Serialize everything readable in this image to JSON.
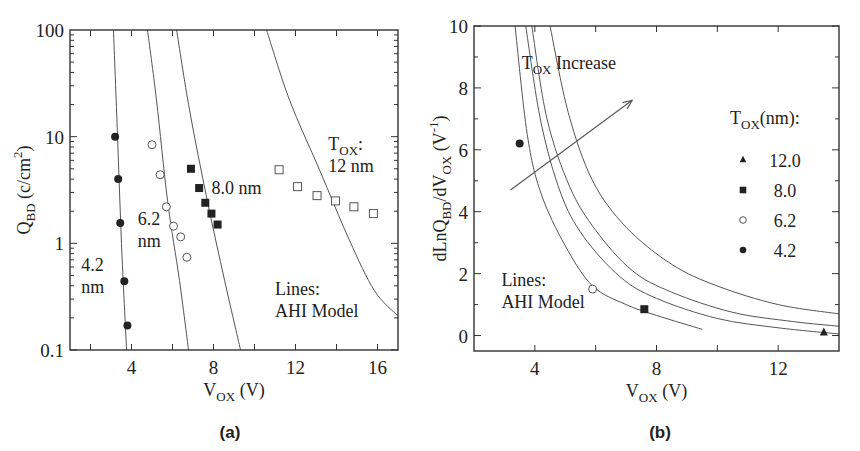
{
  "chart_data": [
    {
      "id": "a",
      "type": "scatter",
      "caption": "(a)",
      "xlabel": {
        "main": "V",
        "sub": "OX",
        "tail": " (V)"
      },
      "ylabel": {
        "main": "Q",
        "sub": "BD",
        "tail": " (c/cm",
        "sup": "2",
        "end": ")"
      },
      "xscale": "linear",
      "yscale": "log",
      "xlim": [
        1,
        17
      ],
      "ylim": [
        0.1,
        100
      ],
      "xticks": [
        2,
        4,
        6,
        8,
        10,
        12,
        14,
        16
      ],
      "xticklabels": [
        {
          "v": 4,
          "label": "4"
        },
        {
          "v": 8,
          "label": "8"
        },
        {
          "v": 12,
          "label": "12"
        },
        {
          "v": 16,
          "label": "16"
        }
      ],
      "yticklabels": [
        {
          "v": 100,
          "label": "100"
        },
        {
          "v": 10,
          "label": "10"
        },
        {
          "v": 1,
          "label": "1"
        },
        {
          "v": 0.1,
          "label": "0.1"
        }
      ],
      "series": [
        {
          "name": "4.2 nm",
          "marker": "filled-circle",
          "points": [
            [
              3.2,
              10
            ],
            [
              3.35,
              4.0
            ],
            [
              3.45,
              1.55
            ],
            [
              3.65,
              0.44
            ],
            [
              3.8,
              0.17
            ]
          ]
        },
        {
          "name": "6.2 nm",
          "marker": "open-circle",
          "points": [
            [
              5.0,
              8.4
            ],
            [
              5.4,
              4.4
            ],
            [
              5.7,
              2.2
            ],
            [
              6.05,
              1.45
            ],
            [
              6.4,
              1.15
            ],
            [
              6.7,
              0.74
            ]
          ]
        },
        {
          "name": "8.0 nm",
          "marker": "filled-square",
          "points": [
            [
              6.9,
              5.0
            ],
            [
              7.3,
              3.3
            ],
            [
              7.6,
              2.4
            ],
            [
              7.9,
              1.9
            ],
            [
              8.2,
              1.5
            ]
          ]
        },
        {
          "name": "12 nm",
          "marker": "open-square",
          "points": [
            [
              11.2,
              4.9
            ],
            [
              12.1,
              3.4
            ],
            [
              13.05,
              2.8
            ],
            [
              13.95,
              2.5
            ],
            [
              14.85,
              2.2
            ],
            [
              15.8,
              1.9
            ]
          ]
        }
      ],
      "model_lines": [
        {
          "name": "AHI 4.2 nm",
          "points": [
            [
              3.12,
              100
            ],
            [
              3.32,
              10
            ],
            [
              3.51,
              1
            ],
            [
              3.76,
              0.1
            ]
          ]
        },
        {
          "name": "AHI 6.2 nm",
          "points": [
            [
              4.78,
              100
            ],
            [
              5.22,
              22
            ],
            [
              5.76,
              2.5
            ],
            [
              6.34,
              0.45
            ],
            [
              6.78,
              0.1
            ]
          ]
        },
        {
          "name": "AHI 8.0 nm",
          "points": [
            [
              6.2,
              100
            ],
            [
              6.83,
              17.8
            ],
            [
              7.7,
              2.5
            ],
            [
              8.54,
              0.45
            ],
            [
              9.32,
              0.1
            ]
          ]
        },
        {
          "name": "AHI 12 nm",
          "points": [
            [
              10.59,
              100
            ],
            [
              11.71,
              22
            ],
            [
              13.17,
              4.9
            ],
            [
              14.63,
              1.07
            ],
            [
              15.85,
              0.36
            ],
            [
              16.98,
              0.21
            ]
          ]
        }
      ],
      "annotations": [
        {
          "id": "label-42",
          "lines": [
            "4.2",
            "nm"
          ],
          "at": [
            1.55,
            0.55
          ]
        },
        {
          "id": "label-62",
          "lines": [
            "6.2",
            "nm"
          ],
          "at": [
            4.3,
            1.5
          ]
        },
        {
          "id": "label-80",
          "lines": [
            "8.0 nm"
          ],
          "at": [
            7.9,
            2.9
          ]
        },
        {
          "id": "label-12",
          "lines": [
            "T|OX|:",
            "12 nm"
          ],
          "at": [
            13.6,
            7.5
          ]
        },
        {
          "id": "lines-note",
          "lines": [
            "Lines:",
            "AHI Model"
          ],
          "at": [
            11.0,
            0.33
          ]
        }
      ],
      "grid": false,
      "legend": null
    },
    {
      "id": "b",
      "type": "scatter",
      "caption": "(b)",
      "xlabel": {
        "main": "V",
        "sub": "OX",
        "tail": " (V)"
      },
      "ylabel": {
        "main": "dLnQ",
        "sub": "BD",
        "mid": "/dV",
        "sub2": "OX",
        "tail": " (V",
        "sup": "-1",
        "end": ")"
      },
      "xscale": "linear",
      "yscale": "linear",
      "xlim": [
        2,
        14
      ],
      "ylim": [
        -0.5,
        10
      ],
      "xticks": [
        4,
        6,
        8,
        10,
        12
      ],
      "xticklabels": [
        {
          "v": 4,
          "label": "4"
        },
        {
          "v": 8,
          "label": "8"
        },
        {
          "v": 12,
          "label": "12"
        }
      ],
      "yticks": [
        0,
        1,
        2,
        3,
        4,
        5,
        6,
        7,
        8,
        9,
        10
      ],
      "yticklabels": [
        {
          "v": 0,
          "label": "0"
        },
        {
          "v": 2,
          "label": "2"
        },
        {
          "v": 4,
          "label": "4"
        },
        {
          "v": 6,
          "label": "6"
        },
        {
          "v": 8,
          "label": "8"
        },
        {
          "v": 10,
          "label": "10"
        }
      ],
      "series": [
        {
          "name": "12.0",
          "marker": "filled-triangle",
          "points": [
            [
              13.5,
              0.1
            ]
          ]
        },
        {
          "name": "8.0",
          "marker": "filled-square",
          "points": [
            [
              7.6,
              0.85
            ]
          ]
        },
        {
          "name": "6.2",
          "marker": "open-circle",
          "points": [
            [
              5.9,
              1.5
            ]
          ]
        },
        {
          "name": "4.2",
          "marker": "filled-circle",
          "points": [
            [
              3.5,
              6.2
            ]
          ]
        }
      ],
      "model_lines": [
        {
          "name": "AHI 4.2 nm",
          "points": [
            [
              3.35,
              10
            ],
            [
              3.75,
              6.5
            ],
            [
              4.2,
              4.6
            ],
            [
              5.0,
              2.9
            ],
            [
              5.9,
              1.6
            ],
            [
              7.0,
              1.0
            ],
            [
              8.0,
              0.65
            ],
            [
              9.5,
              0.2
            ]
          ]
        },
        {
          "name": "AHI 6.2 nm",
          "points": [
            [
              3.7,
              10
            ],
            [
              4.2,
              6.9
            ],
            [
              4.85,
              4.6
            ],
            [
              5.6,
              3.2
            ],
            [
              6.8,
              1.9
            ],
            [
              8.0,
              1.2
            ],
            [
              10.0,
              0.55
            ],
            [
              12.0,
              0.25
            ],
            [
              14.0,
              0.05
            ]
          ]
        },
        {
          "name": "AHI 8.0 nm",
          "points": [
            [
              3.9,
              10
            ],
            [
              4.4,
              7.0
            ],
            [
              5.15,
              4.8
            ],
            [
              6.0,
              3.4
            ],
            [
              7.2,
              2.1
            ],
            [
              8.5,
              1.4
            ],
            [
              10.5,
              0.75
            ],
            [
              12.5,
              0.45
            ],
            [
              14.0,
              0.3
            ]
          ]
        },
        {
          "name": "AHI 12 nm",
          "points": [
            [
              4.5,
              10
            ],
            [
              5.1,
              7.2
            ],
            [
              5.9,
              5.0
            ],
            [
              7.0,
              3.5
            ],
            [
              8.5,
              2.3
            ],
            [
              10.0,
              1.6
            ],
            [
              12.0,
              1.0
            ],
            [
              14.0,
              0.7
            ]
          ]
        }
      ],
      "arrow": {
        "from": [
          3.2,
          4.7
        ],
        "to": [
          7.2,
          7.6
        ],
        "label": {
          "main": "T",
          "sub": "OX",
          "tail": " Increase",
          "at": [
            6.0,
            8.6
          ]
        }
      },
      "annotations": [
        {
          "id": "lines-note",
          "lines": [
            "Lines:",
            "AHI Model"
          ],
          "at": [
            2.9,
            1.6
          ]
        }
      ],
      "legend": {
        "title": {
          "main": "T",
          "sub": "OX",
          "tail": "(nm):"
        },
        "position": "right",
        "entries": [
          {
            "marker": "filled-triangle",
            "label": "12.0"
          },
          {
            "marker": "filled-square",
            "label": "8.0"
          },
          {
            "marker": "open-circle",
            "label": "6.2"
          },
          {
            "marker": "filled-circle",
            "label": "4.2"
          }
        ]
      },
      "grid": false
    }
  ],
  "colors": {
    "frame": "#333333",
    "model_line": "#555555",
    "marker": "#222222",
    "text": "#222222",
    "background": "#ffffff"
  }
}
